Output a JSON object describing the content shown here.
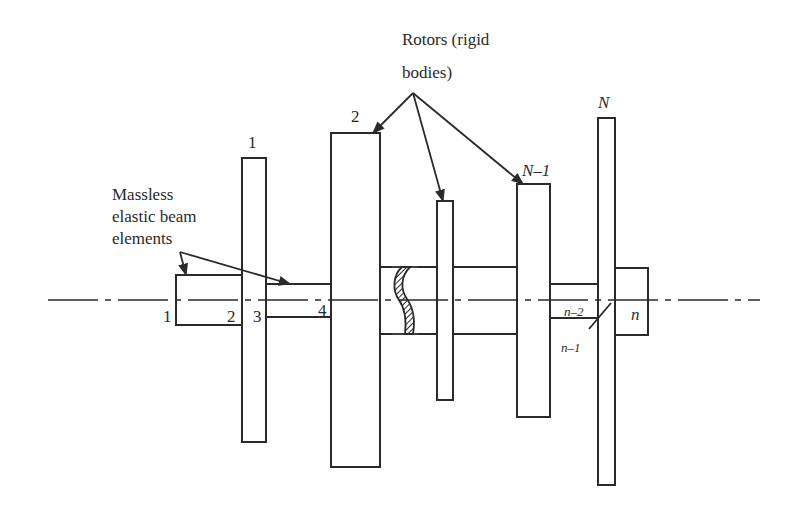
{
  "diagram": {
    "type": "rotor-shaft system schematic",
    "callouts": {
      "rotors": {
        "line1": "Rotors (rigid",
        "line2": "bodies)"
      },
      "beams": {
        "line1": "Massless",
        "line2": "elastic beam",
        "line3": "elements"
      }
    },
    "rotor_labels": {
      "r1": "1",
      "r2": "2",
      "rN1": "N–1",
      "rN": "N"
    },
    "node_labels": {
      "n1": "1",
      "n2": "2",
      "n3": "3",
      "n4": "4",
      "nm2": "n–2",
      "nm1": "n–1",
      "n": "n"
    },
    "colors": {
      "stroke": "#2a2a2a",
      "background": "#ffffff"
    }
  }
}
